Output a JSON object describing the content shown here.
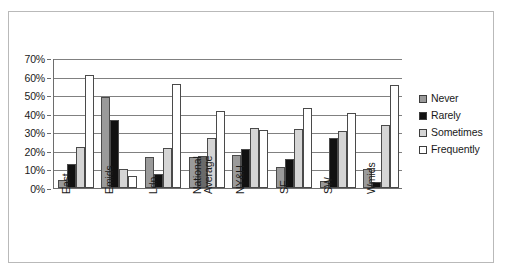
{
  "caption": {
    "text": "",
    "note": "partially-cropped faint text row at top edge"
  },
  "legend": {
    "position": "right",
    "items": [
      {
        "label": "Never",
        "color": "#9a9a9a",
        "swatch": "series-swatch-never"
      },
      {
        "label": "Rarely",
        "color": "#111111",
        "swatch": "series-swatch-rarely"
      },
      {
        "label": "Sometimes",
        "color": "#d5d5d5",
        "swatch": "series-swatch-sometimes"
      },
      {
        "label": "Frequently",
        "color": "#ffffff",
        "swatch": "series-swatch-frequently"
      }
    ]
  },
  "y_axis": {
    "ticks": [
      "0%",
      "10%",
      "20%",
      "30%",
      "40%",
      "50%",
      "60%",
      "70%"
    ],
    "values": [
      0,
      10,
      20,
      30,
      40,
      50,
      60,
      70
    ],
    "min": 0,
    "max": 70
  },
  "x_axis": {
    "categories": [
      "East",
      "Emids",
      "Ldn",
      "National Average",
      "NY&H",
      "SE",
      "SW",
      "Wmids"
    ],
    "category_lines": [
      [
        "East"
      ],
      [
        "Emids"
      ],
      [
        "Ldn"
      ],
      [
        "National",
        "Average"
      ],
      [
        "NY&H"
      ],
      [
        "SE"
      ],
      [
        "SW"
      ],
      [
        "Wmids"
      ]
    ]
  },
  "chart_data": {
    "type": "bar",
    "title": "",
    "xlabel": "",
    "ylabel": "",
    "ylim": [
      0,
      70
    ],
    "grid": true,
    "legend_position": "right",
    "value_unit": "percent",
    "categories": [
      "East",
      "Emids",
      "Ldn",
      "National Average",
      "NY&H",
      "SE",
      "SW",
      "Wmids"
    ],
    "series": [
      {
        "name": "Never",
        "color": "#9a9a9a",
        "values": [
          4.5,
          49.0,
          16.5,
          16.5,
          18.0,
          11.5,
          3.8,
          10.0
        ]
      },
      {
        "name": "Rarely",
        "color": "#111111",
        "values": [
          13.0,
          36.5,
          7.5,
          17.0,
          21.0,
          15.5,
          27.0,
          3.0
        ]
      },
      {
        "name": "Sometimes",
        "color": "#d5d5d5",
        "values": [
          22.0,
          10.0,
          21.5,
          27.0,
          32.5,
          32.0,
          30.5,
          34.0
        ]
      },
      {
        "name": "Frequently",
        "color": "#ffffff",
        "values": [
          61.0,
          6.5,
          56.0,
          41.5,
          31.0,
          43.0,
          40.5,
          55.5
        ]
      }
    ]
  },
  "style": {
    "frame_border": "#b9b9b9",
    "gridline": "#808080",
    "axis_line": "#6d6d6d",
    "bar_outline": "#4a4a4a",
    "background": "#ffffff"
  }
}
